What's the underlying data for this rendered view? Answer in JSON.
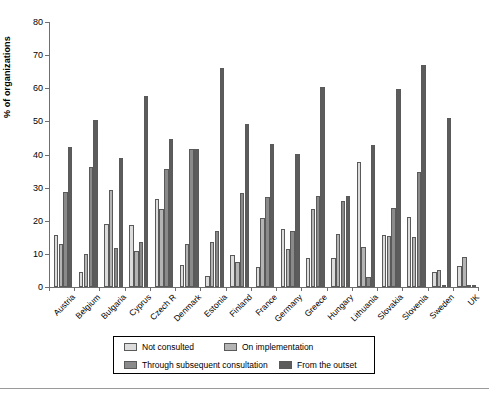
{
  "chart_data": {
    "type": "bar",
    "title": "",
    "xlabel": "",
    "ylabel": "% of organizations",
    "ylim": [
      0,
      80
    ],
    "yticks": [
      0,
      10,
      20,
      30,
      40,
      50,
      60,
      70,
      80
    ],
    "grid": false,
    "legend_position": "bottom",
    "categories": [
      "Austria",
      "Belgium",
      "Bulgaria",
      "Cyprus",
      "Czech R",
      "Denmark",
      "Estonia",
      "Finland",
      "France",
      "Germany",
      "Greece",
      "Hungary",
      "Lithuania",
      "Slovakia",
      "Slovenia",
      "Sweden",
      "UK"
    ],
    "series": [
      {
        "name": "Not consulted",
        "color": "#dcdcdc",
        "values": [
          15.8,
          4.4,
          19.0,
          18.6,
          26.5,
          6.7,
          3.4,
          9.7,
          5.9,
          17.6,
          8.9,
          8.9,
          37.7,
          15.6,
          21.1,
          4.6,
          6.3
        ]
      },
      {
        "name": "On implementation",
        "color": "#b4b4b4",
        "values": [
          13.1,
          9.9,
          29.2,
          11.0,
          23.5,
          13.0,
          13.5,
          7.6,
          20.7,
          11.5,
          23.5,
          15.9,
          12.1,
          15.4,
          15.0,
          5.0,
          9.0
        ]
      },
      {
        "name": "Through subsequent consultation",
        "color": "#8a8a8a",
        "values": [
          28.8,
          36.3,
          11.8,
          13.6,
          35.7,
          41.6,
          16.9,
          28.3,
          27.3,
          16.8,
          27.6,
          25.9,
          3.1,
          23.8,
          34.6,
          0,
          0
        ]
      },
      {
        "name": "From the outset",
        "color": "#5c5c5c",
        "values": [
          42.4,
          50.3,
          39.0,
          57.6,
          44.8,
          41.6,
          66.2,
          49.1,
          43.3,
          40.3,
          60.5,
          27.5,
          42.9,
          59.9,
          67.0,
          51.0,
          0
        ]
      }
    ]
  },
  "chart_series_by_country": {
    "Austria": [
      15.8,
      13.1,
      28.8,
      42.4
    ],
    "Belgium": [
      4.4,
      9.9,
      36.3,
      50.3
    ],
    "Bulgaria": [
      19.0,
      29.2,
      11.8,
      39.0
    ],
    "Cyprus": [
      18.6,
      11.0,
      13.6,
      57.6
    ],
    "Czech R": [
      26.5,
      23.5,
      35.7,
      44.8
    ],
    "Denmark": [
      6.7,
      13.0,
      41.6,
      41.6
    ],
    "Estonia": [
      3.4,
      13.5,
      16.9,
      66.2
    ],
    "Finland": [
      9.7,
      7.6,
      28.3,
      49.1
    ],
    "France": [
      5.9,
      20.7,
      27.3,
      43.3
    ],
    "Germany": [
      17.6,
      11.5,
      16.8,
      40.3
    ],
    "Greece": [
      8.9,
      23.5,
      27.6,
      60.5
    ],
    "Hungary": [
      8.9,
      15.9,
      25.9,
      27.5
    ],
    "Lithuania": [
      37.7,
      12.1,
      3.1,
      42.9
    ],
    "Slovakia": [
      15.6,
      15.4,
      23.8,
      59.9
    ],
    "Slovenia": [
      21.1,
      15.0,
      34.6,
      67.0
    ],
    "Sweden": [
      4.6,
      5.0,
      23.8,
      51.0
    ],
    "UK": [
      6.3,
      9.0,
      34.6,
      51.0
    ]
  },
  "axis": {
    "y_title": "% of organizations",
    "y_ticks": [
      "0",
      "10",
      "20",
      "30",
      "40",
      "50",
      "60",
      "70",
      "80"
    ]
  },
  "legend": {
    "items": [
      {
        "label": "Not consulted",
        "color": "#dcdcdc"
      },
      {
        "label": "On implementation",
        "color": "#b4b4b4"
      },
      {
        "label": "Through subsequent consultation",
        "color": "#8a8a8a"
      },
      {
        "label": "From the outset",
        "color": "#5c5c5c"
      }
    ]
  }
}
